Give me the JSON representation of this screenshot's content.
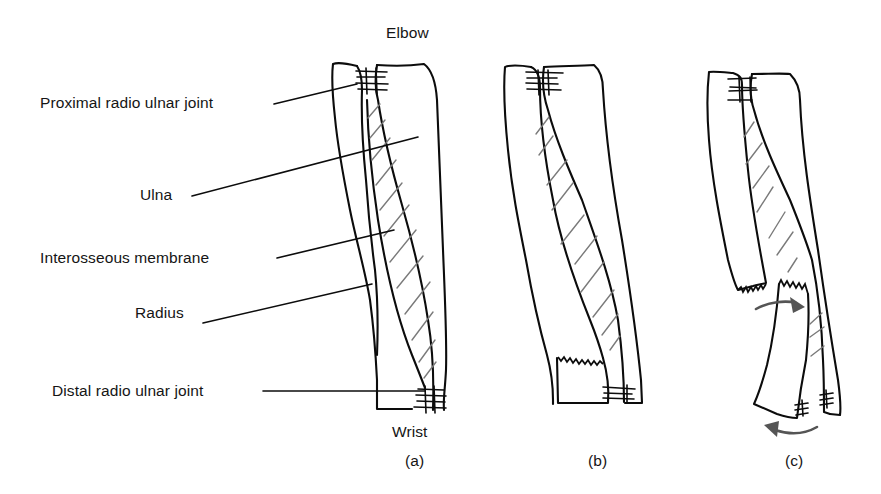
{
  "figure": {
    "orientation_labels": {
      "top": "Elbow",
      "bottom": "Wrist"
    },
    "annotations": [
      {
        "id": "proximal_joint",
        "label": "Proximal radio ulnar joint"
      },
      {
        "id": "ulna",
        "label": "Ulna"
      },
      {
        "id": "membrane",
        "label": "Interosseous membrane"
      },
      {
        "id": "radius",
        "label": "Radius"
      },
      {
        "id": "distal_joint",
        "label": "Distal radio ulnar joint"
      }
    ],
    "panels": [
      {
        "id": "a",
        "caption": "(a)",
        "description": "Intact radius and ulna with interosseous membrane"
      },
      {
        "id": "b",
        "caption": "(b)",
        "description": "Fracture of the radius (zig-zag line) near distal end"
      },
      {
        "id": "c",
        "caption": "(c)",
        "description": "Displaced radius fracture with rotation arrows"
      }
    ],
    "colors": {
      "outline": "#0c0c0c",
      "hatch": "#7a7a7a",
      "arrow": "#555555",
      "background": "#ffffff"
    }
  }
}
